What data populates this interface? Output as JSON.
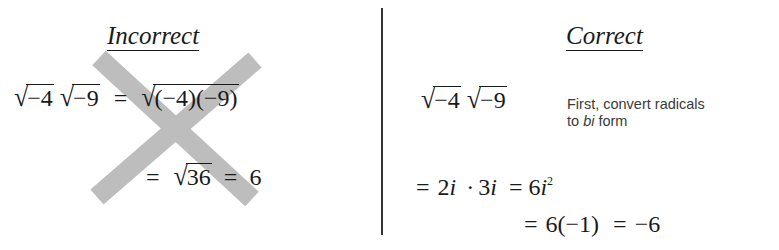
{
  "incorrect": {
    "heading": "Incorrect",
    "line1": {
      "rad1": "−4",
      "rad2": "−9",
      "eq": "=",
      "rad3": "(−4)(−9)"
    },
    "line2": {
      "eq1": "=",
      "rad": "36",
      "eq2": "=",
      "result": "6"
    },
    "cross_color": "#b3b3b3"
  },
  "correct": {
    "heading": "Correct",
    "line1": {
      "rad1": "−4",
      "rad2": "−9"
    },
    "note": {
      "line1": "First, convert radicals",
      "pre": "to ",
      "em": "bi",
      "post": " form"
    },
    "line2": {
      "eq1": "=",
      "a": "2",
      "i1": "i",
      "dot": "·",
      "b": "3",
      "i2": "i",
      "eq2": "=",
      "c": "6",
      "i3": "i",
      "exp": "2"
    },
    "line3": {
      "eq1": "=",
      "expr": "6(−1)",
      "eq2": "=",
      "result": "−6"
    }
  }
}
